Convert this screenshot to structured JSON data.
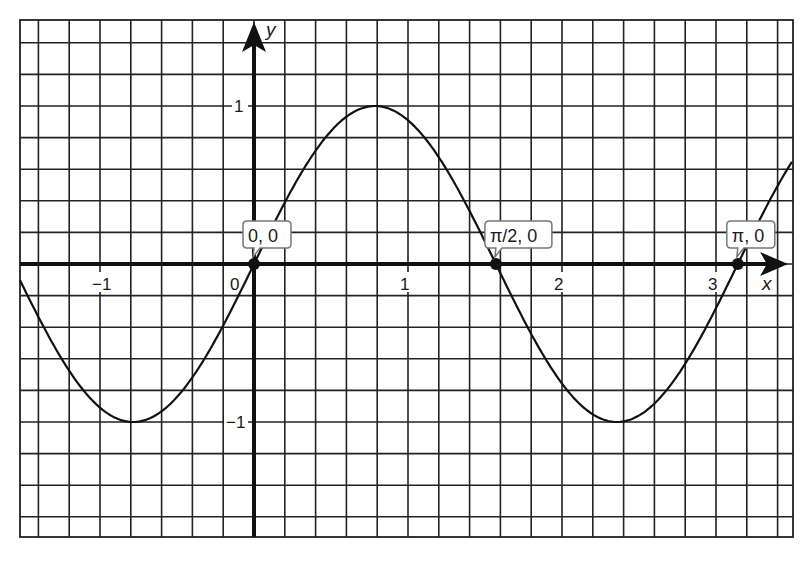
{
  "chart_data": {
    "type": "line",
    "title": "",
    "function": "y = sin(2x)",
    "xlabel": "x",
    "ylabel": "y",
    "xlim": [
      -1.52,
      3.52
    ],
    "ylim": [
      -1.72,
      1.54
    ],
    "grid": true,
    "grid_step_x": 0.2,
    "grid_step_y": 0.2,
    "x_ticks": [
      {
        "value": -1,
        "label": "−1"
      },
      {
        "value": 0,
        "label": "0"
      },
      {
        "value": 1,
        "label": "1"
      },
      {
        "value": 2,
        "label": "2"
      },
      {
        "value": 3,
        "label": "3"
      }
    ],
    "y_ticks": [
      {
        "value": 1,
        "label": "1"
      },
      {
        "value": -1,
        "label": "−1"
      }
    ],
    "series": [
      {
        "name": "sin(2x)",
        "x": [
          -1.52,
          -1.2,
          -0.785,
          -0.4,
          0,
          0.4,
          0.785,
          1.2,
          1.571,
          2.0,
          2.356,
          2.8,
          3.142,
          3.52
        ],
        "y": [
          -0.1,
          -0.68,
          -1.0,
          -0.72,
          0,
          0.72,
          1.0,
          0.68,
          0,
          -0.76,
          -1.0,
          -0.63,
          0,
          0.66
        ]
      }
    ],
    "annotations": [
      {
        "x": 0,
        "y": 0,
        "label": "0, 0"
      },
      {
        "x": 1.5708,
        "y": 0,
        "label": "π/2, 0"
      },
      {
        "x": 3.1416,
        "y": 0,
        "label": "π, 0"
      }
    ],
    "legend": null
  }
}
